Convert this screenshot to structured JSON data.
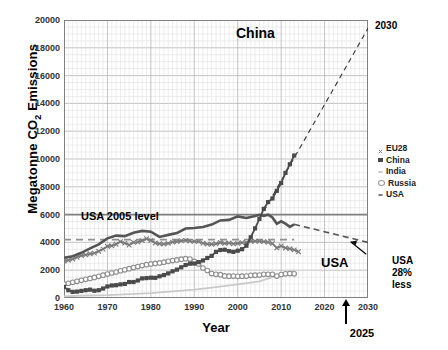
{
  "chart_data": {
    "type": "line",
    "title": "",
    "xlabel": "Year",
    "ylabel": "Megatonne CO2 Emissions",
    "ylabel_html": "Megatonne CO<sub>2</sub> Emissions",
    "xlim": [
      1960,
      2030
    ],
    "ylim": [
      0,
      20000
    ],
    "xticks": [
      1960,
      1970,
      1980,
      1990,
      2000,
      2010,
      2020,
      2030
    ],
    "yticks": [
      0,
      2000,
      4000,
      6000,
      8000,
      10000,
      12000,
      14000,
      16000,
      18000,
      20000
    ],
    "grid": "major and minor (1 year x, 500 Mt y)",
    "legend_position": "right outside",
    "colors": {
      "eu28": "#7a7a7a",
      "china": "#4a4a4a",
      "india": "#c9c9c9",
      "russia": "#8f8f8f",
      "usa": "#555555",
      "usa2005_line": "#808080",
      "usa_target_line": "#909090",
      "china_projection": "#333333",
      "grid": "#c8c8c8",
      "axis": "#808080"
    },
    "series": [
      {
        "name": "EU28",
        "marker": "x",
        "color": "#7a7a7a",
        "x": [
          1960,
          1961,
          1962,
          1963,
          1964,
          1965,
          1966,
          1967,
          1968,
          1969,
          1970,
          1971,
          1972,
          1973,
          1974,
          1975,
          1976,
          1977,
          1978,
          1979,
          1980,
          1981,
          1982,
          1983,
          1984,
          1985,
          1986,
          1987,
          1988,
          1989,
          1990,
          1991,
          1992,
          1993,
          1994,
          1995,
          1996,
          1997,
          1998,
          1999,
          2000,
          2001,
          2002,
          2003,
          2004,
          2005,
          2006,
          2007,
          2008,
          2009,
          2010,
          2011,
          2012,
          2013,
          2014
        ],
        "y": [
          2650,
          2720,
          2800,
          2930,
          3050,
          3100,
          3180,
          3230,
          3360,
          3520,
          3720,
          3760,
          3870,
          4060,
          3950,
          3810,
          4000,
          4020,
          4130,
          4260,
          4150,
          3960,
          3900,
          3880,
          3930,
          4020,
          4060,
          4120,
          4150,
          4090,
          4070,
          4060,
          3940,
          3880,
          3870,
          3900,
          3990,
          3930,
          3960,
          3890,
          3930,
          3980,
          3980,
          4080,
          4090,
          4070,
          4060,
          4010,
          3920,
          3600,
          3740,
          3600,
          3540,
          3460,
          3330
        ]
      },
      {
        "name": "China",
        "marker": "filled-square",
        "color": "#4a4a4a",
        "x": [
          1960,
          1961,
          1962,
          1963,
          1964,
          1965,
          1966,
          1967,
          1968,
          1969,
          1970,
          1971,
          1972,
          1973,
          1974,
          1975,
          1976,
          1977,
          1978,
          1979,
          1980,
          1981,
          1982,
          1983,
          1984,
          1985,
          1986,
          1987,
          1988,
          1989,
          1990,
          1991,
          1992,
          1993,
          1994,
          1995,
          1996,
          1997,
          1998,
          1999,
          2000,
          2001,
          2002,
          2003,
          2004,
          2005,
          2006,
          2007,
          2008,
          2009,
          2010,
          2011,
          2012,
          2013
        ],
        "y": [
          800,
          560,
          440,
          460,
          510,
          560,
          600,
          520,
          560,
          680,
          830,
          900,
          920,
          980,
          1010,
          1150,
          1150,
          1260,
          1410,
          1430,
          1460,
          1450,
          1560,
          1650,
          1770,
          1920,
          2040,
          2210,
          2370,
          2470,
          2480,
          2580,
          2700,
          2880,
          3030,
          3320,
          3450,
          3470,
          3370,
          3320,
          3400,
          3510,
          3760,
          4370,
          5010,
          5690,
          6410,
          6900,
          7160,
          7710,
          8270,
          9000,
          9620,
          10250
        ]
      },
      {
        "name": "India",
        "marker": "dot",
        "color": "#c9c9c9",
        "x": [
          1960,
          1965,
          1970,
          1975,
          1980,
          1985,
          1990,
          1995,
          2000,
          2005,
          2010,
          2013
        ],
        "y": [
          120,
          180,
          210,
          280,
          350,
          480,
          600,
          780,
          980,
          1200,
          1700,
          1980
        ]
      },
      {
        "name": "Russia",
        "marker": "open-circle",
        "color": "#8f8f8f",
        "x": [
          1960,
          1961,
          1962,
          1963,
          1964,
          1965,
          1966,
          1967,
          1968,
          1969,
          1970,
          1971,
          1972,
          1973,
          1974,
          1975,
          1976,
          1977,
          1978,
          1979,
          1980,
          1981,
          1982,
          1983,
          1984,
          1985,
          1986,
          1987,
          1988,
          1989,
          1990,
          1991,
          1992,
          1993,
          1994,
          1995,
          1996,
          1997,
          1998,
          1999,
          2000,
          2001,
          2002,
          2003,
          2004,
          2005,
          2006,
          2007,
          2008,
          2009,
          2010,
          2011,
          2012,
          2013
        ],
        "y": [
          1000,
          1060,
          1130,
          1200,
          1270,
          1340,
          1410,
          1480,
          1560,
          1640,
          1720,
          1800,
          1870,
          1960,
          2030,
          2110,
          2190,
          2260,
          2330,
          2400,
          2450,
          2490,
          2520,
          2580,
          2640,
          2690,
          2740,
          2790,
          2830,
          2800,
          2630,
          2450,
          2160,
          1980,
          1760,
          1700,
          1680,
          1590,
          1570,
          1580,
          1560,
          1570,
          1580,
          1630,
          1640,
          1650,
          1700,
          1700,
          1710,
          1580,
          1690,
          1740,
          1760,
          1740
        ]
      },
      {
        "name": "USA",
        "marker": "dot",
        "color": "#555555",
        "x": [
          1960,
          1962,
          1964,
          1966,
          1968,
          1970,
          1972,
          1974,
          1976,
          1978,
          1980,
          1982,
          1984,
          1986,
          1988,
          1990,
          1992,
          1994,
          1996,
          1998,
          2000,
          2002,
          2004,
          2005,
          2006,
          2007,
          2008,
          2009,
          2010,
          2011,
          2012,
          2013
        ],
        "y": [
          2890,
          3010,
          3250,
          3570,
          3860,
          4290,
          4490,
          4450,
          4700,
          4830,
          4770,
          4390,
          4540,
          4670,
          5000,
          5040,
          5110,
          5280,
          5580,
          5620,
          5870,
          5760,
          5900,
          5990,
          5910,
          5990,
          5790,
          5340,
          5520,
          5350,
          5120,
          5300
        ]
      }
    ],
    "reference_lines": [
      {
        "name": "USA 2005 level",
        "value": 6000,
        "style": "solid",
        "label": "USA 2005 level"
      },
      {
        "name": "USA 28% less target",
        "value": 4200,
        "style": "dashed",
        "label": "USA 28% less"
      }
    ],
    "projections": [
      {
        "name": "China projection",
        "style": "dashed",
        "from": [
          2005,
          5690
        ],
        "to": [
          2030,
          19400
        ]
      },
      {
        "name": "USA target path",
        "style": "dashed",
        "from": [
          2013,
          5300
        ],
        "to": [
          2030,
          4000
        ]
      }
    ],
    "annotations": [
      {
        "name": "china-label",
        "text": "China"
      },
      {
        "name": "usa-label",
        "text": "USA"
      },
      {
        "name": "year-2030-label",
        "text": "2030"
      },
      {
        "name": "usa-2005-level-label",
        "text": "USA 2005 level"
      },
      {
        "name": "usa-28-less-label",
        "text": "USA\n28%\nless"
      },
      {
        "name": "year-2025-label",
        "text": "2025"
      }
    ]
  },
  "axes": {
    "ylabel_pre": "Megatonne CO",
    "ylabel_sub": "2",
    "ylabel_post": " Emissions",
    "xlabel": "Year",
    "yticks": [
      "20000",
      "18000",
      "16000",
      "14000",
      "12000",
      "10000",
      "8000",
      "6000",
      "4000",
      "2000",
      "0"
    ],
    "xticks": [
      "1960",
      "1970",
      "1980",
      "1990",
      "2000",
      "2010",
      "2020",
      "2030"
    ]
  },
  "legend": {
    "items": [
      {
        "label": "EU28",
        "marker": "x-marker",
        "color": "#7a7a7a"
      },
      {
        "label": "China",
        "marker": "filled-square-marker",
        "color": "#4a4a4a"
      },
      {
        "label": "India",
        "marker": "dot-marker",
        "color": "#c9c9c9"
      },
      {
        "label": "Russia",
        "marker": "open-circle-marker",
        "color": "#9a9a9a"
      },
      {
        "label": "USA",
        "marker": "dot-marker",
        "color": "#777777"
      }
    ]
  },
  "annotations": {
    "china": "China",
    "usa": "USA",
    "year_2030": "2030",
    "usa_2005_level": "USA 2005 level",
    "usa_28_less_l1": "USA",
    "usa_28_less_l2": "28%",
    "usa_28_less_l3": "less",
    "year_2025": "2025"
  }
}
